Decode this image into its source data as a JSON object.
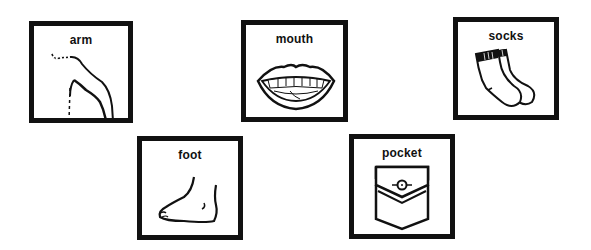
{
  "cards": [
    {
      "id": "arm",
      "label": "arm",
      "icon": "arm-icon"
    },
    {
      "id": "mouth",
      "label": "mouth",
      "icon": "mouth-icon"
    },
    {
      "id": "socks",
      "label": "socks",
      "icon": "socks-icon"
    },
    {
      "id": "foot",
      "label": "foot",
      "icon": "foot-icon"
    },
    {
      "id": "pocket",
      "label": "pocket",
      "icon": "pocket-icon"
    }
  ],
  "colors": {
    "border": "#111111",
    "background": "#ffffff",
    "ink": "#111111"
  }
}
